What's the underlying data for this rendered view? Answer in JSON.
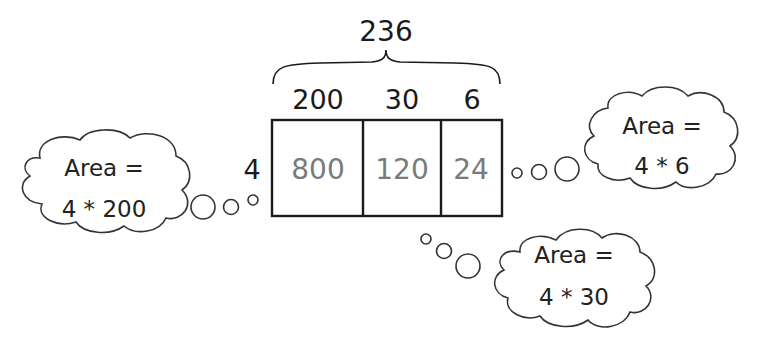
{
  "diagram": {
    "title_total": "236",
    "columns": [
      {
        "header": "200",
        "product": "800"
      },
      {
        "header": "30",
        "product": "120"
      },
      {
        "header": "6",
        "product": "24"
      }
    ],
    "row_factor": "4",
    "clouds": [
      {
        "line1": "Area =",
        "line2": "4 * 200"
      },
      {
        "line1": "Area =",
        "line2": "4 * 6"
      },
      {
        "line1": "Area =",
        "line2": "4 * 30"
      }
    ],
    "colors": {
      "stroke": "#1a1a1a",
      "product_text": "#7a7a7a",
      "background": "#ffffff"
    }
  }
}
